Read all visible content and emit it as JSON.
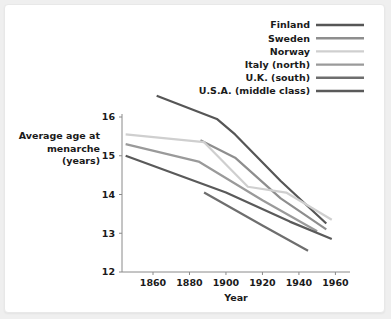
{
  "chart_data": {
    "type": "line",
    "title": "",
    "xlabel": "Year",
    "ylabel": "Average age at menarche (years)",
    "ylabel_lines": [
      "Average age at",
      "menarche",
      "(years)"
    ],
    "xlim": [
      1843,
      1968
    ],
    "ylim": [
      12,
      16
    ],
    "xticks": [
      1860,
      1880,
      1900,
      1920,
      1940,
      1960
    ],
    "yticks": [
      12,
      13,
      14,
      15,
      16
    ],
    "grid": false,
    "legend_position": "top-right",
    "series": [
      {
        "name": "Finland",
        "color": "#565656",
        "x": [
          1862,
          1895,
          1905,
          1930,
          1955
        ],
        "y": [
          16.55,
          15.95,
          15.55,
          14.35,
          13.25
        ]
      },
      {
        "name": "Sweden",
        "color": "#8e8e8e",
        "x": [
          1886,
          1905,
          1930,
          1955
        ],
        "y": [
          15.4,
          14.95,
          13.9,
          13.1
        ]
      },
      {
        "name": "Norway",
        "color": "#cfcfcf",
        "x": [
          1845,
          1888,
          1912,
          1933,
          1958
        ],
        "y": [
          15.55,
          15.35,
          14.2,
          14.05,
          13.35
        ]
      },
      {
        "name": "Italy (north)",
        "color": "#9a9a9a",
        "x": [
          1845,
          1885,
          1920,
          1950
        ],
        "y": [
          15.3,
          14.85,
          13.85,
          13.05
        ]
      },
      {
        "name": "U.K. (south)",
        "color": "#6e6e6e",
        "x": [
          1888,
          1920,
          1945
        ],
        "y": [
          14.05,
          13.2,
          12.55
        ]
      },
      {
        "name": "U.S.A. (middle class)",
        "color": "#5a5a5a",
        "x": [
          1845,
          1900,
          1935,
          1958
        ],
        "y": [
          15.0,
          14.05,
          13.3,
          12.85
        ]
      }
    ]
  },
  "legend": {
    "items": [
      {
        "label": "Finland",
        "color": "#565656"
      },
      {
        "label": "Sweden",
        "color": "#8e8e8e"
      },
      {
        "label": "Norway",
        "color": "#cfcfcf"
      },
      {
        "label": "Italy (north)",
        "color": "#9a9a9a"
      },
      {
        "label": "U.K. (south)",
        "color": "#6e6e6e"
      },
      {
        "label": "U.S.A. (middle class)",
        "color": "#5a5a5a"
      }
    ]
  }
}
